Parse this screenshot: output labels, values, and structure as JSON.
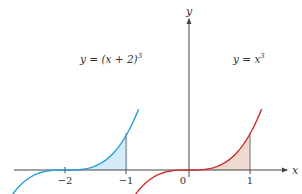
{
  "chart_data": {
    "type": "line",
    "title": "",
    "xlabel": "x",
    "ylabel": "y",
    "x_ticks": [
      "−2",
      "−1",
      "0",
      "1"
    ],
    "series": [
      {
        "name": "y = (x + 2)^3",
        "label_main": "y = (x + 2)",
        "label_sup": "3",
        "color": "#2a9fd6",
        "fill": "#d3ecf8",
        "shaded_interval": [
          -2,
          -1
        ],
        "x": [
          -2.9,
          -2.5,
          -2,
          -1.5,
          -1,
          -0.8
        ],
        "values": [
          -0.729,
          -0.125,
          0,
          0.125,
          1,
          1.728
        ]
      },
      {
        "name": "y = x^3",
        "label_main": "y = x",
        "label_sup": "3",
        "color": "#c8322d",
        "fill": "#ecd9cf",
        "shaded_interval": [
          0,
          1
        ],
        "x": [
          -0.9,
          -0.5,
          0,
          0.5,
          1,
          1.2
        ],
        "values": [
          -0.729,
          -0.125,
          0,
          0.125,
          1,
          1.728
        ]
      }
    ],
    "grid": false,
    "legend": "inline labels"
  },
  "axes": {
    "x_label": "x",
    "y_label": "y",
    "tick_labels": {
      "neg2": "−2",
      "neg1": "−1",
      "zero": "0",
      "one": "1"
    }
  },
  "labels": {
    "left_curve": "y = (x + 2)",
    "left_sup": "3",
    "right_curve": "y = x",
    "right_sup": "3"
  },
  "colors": {
    "axis": "#444444",
    "blue_curve": "#2a9fd6",
    "blue_fill": "#d3ecf8",
    "red_curve": "#c8322d",
    "red_fill": "#ecd9cf"
  }
}
